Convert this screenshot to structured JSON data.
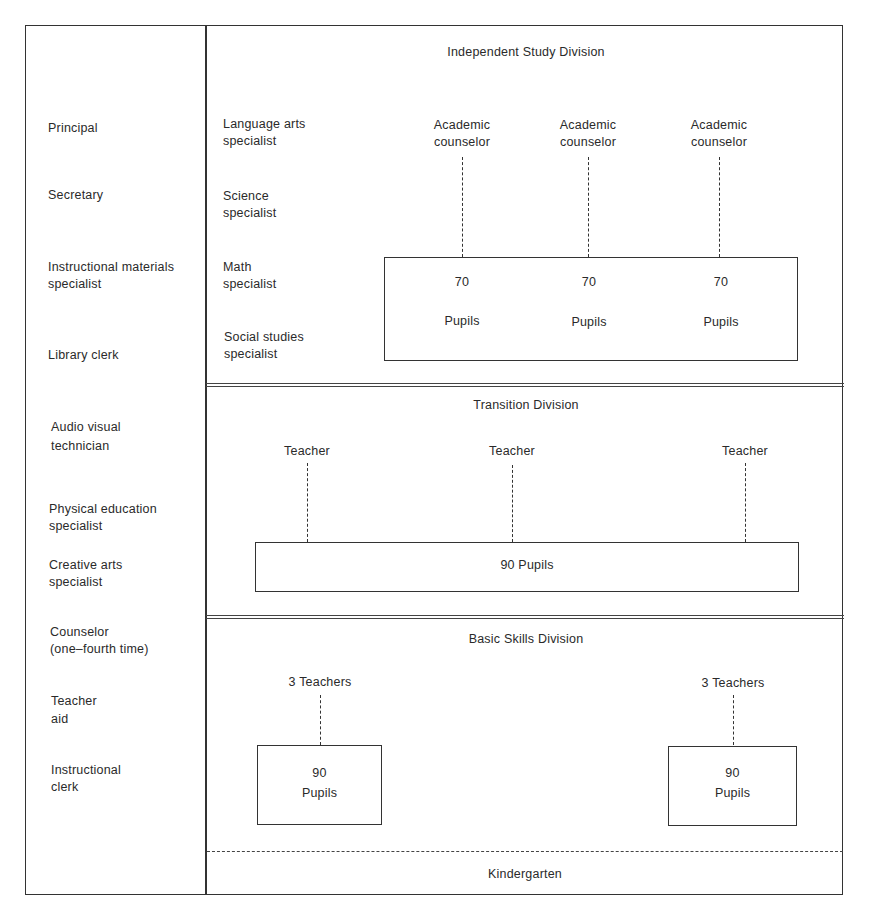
{
  "staff_column": {
    "items": [
      {
        "label": "Principal",
        "top": 120
      },
      {
        "label": "Secretary",
        "top": 187
      },
      {
        "label": "Instructional materials\nspecialist",
        "top": 259
      },
      {
        "label": "Library clerk",
        "top": 347
      },
      {
        "label": "Audio visual\ntechnician",
        "top": 417
      },
      {
        "label": "Physical education\nspecialist",
        "top": 500
      },
      {
        "label": "Creative arts\nspecialist",
        "top": 557
      },
      {
        "label": "Counselor\n(one–fourth time)",
        "top": 623
      },
      {
        "label": "Teacher\naid",
        "top": 691
      },
      {
        "label": "Instructional\nclerk",
        "top": 762
      }
    ]
  },
  "divisions": {
    "independent_study": {
      "title": "Independent Study Division",
      "specialists": [
        {
          "label": "Language arts\nspecialist",
          "top": 118
        },
        {
          "label": "Science\nspecialist",
          "top": 188
        },
        {
          "label": "Math\nspecialist",
          "top": 259
        },
        {
          "label": "Social studies\nspecialist",
          "top": 329
        }
      ],
      "counselors": [
        {
          "label": "Academic\ncounselor",
          "x": 462
        },
        {
          "label": "Academic\ncounselor",
          "x": 588
        },
        {
          "label": "Academic\ncounselor",
          "x": 719
        }
      ],
      "groups": [
        {
          "count": "70",
          "unit": "Pupils",
          "x": 462
        },
        {
          "count": "70",
          "unit": "Pupils",
          "x": 589
        },
        {
          "count": "70",
          "unit": "Pupils",
          "x": 721
        }
      ]
    },
    "transition": {
      "title": "Transition Division",
      "teachers": [
        {
          "label": "Teacher",
          "x": 307
        },
        {
          "label": "Teacher",
          "x": 512
        },
        {
          "label": "Teacher",
          "x": 745
        }
      ],
      "pupils": "90 Pupils"
    },
    "basic_skills": {
      "title": "Basic Skills Division",
      "groups": [
        {
          "teachers": "3 Teachers",
          "count": "90",
          "unit": "Pupils",
          "x": 320
        },
        {
          "teachers": "3 Teachers",
          "count": "90",
          "unit": "Pupils",
          "x": 733
        }
      ]
    },
    "kindergarten": {
      "title": "Kindergarten"
    }
  }
}
